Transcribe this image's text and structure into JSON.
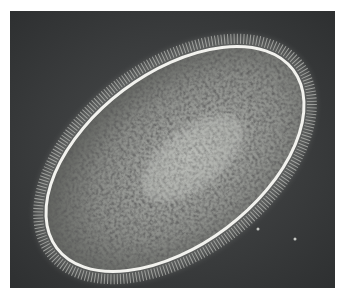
{
  "image": {
    "subject": "ciliate protozoan cell (phase-contrast micrograph)",
    "background_color": "#3a3c3e",
    "border_color": "#ffffff",
    "cell": {
      "shape": "ellipse",
      "membrane_color": "#f2f2ee",
      "cytoplasm_color": "#8a8c88",
      "granule_color": "#1e201f",
      "cilia_color": "#b8bab6"
    }
  }
}
